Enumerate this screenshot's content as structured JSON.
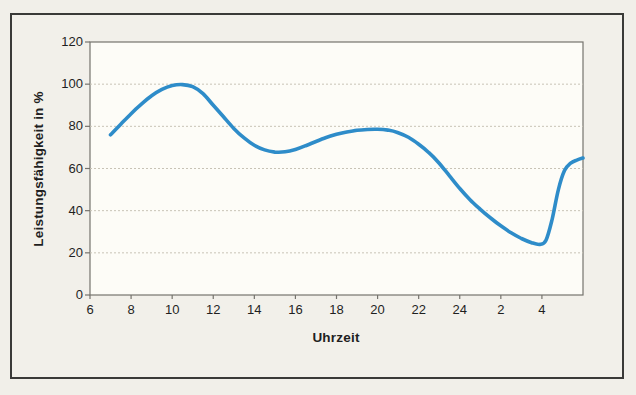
{
  "chart_data": {
    "type": "line",
    "title": "",
    "xlabel": "Uhrzeit",
    "ylabel": "Leistungsfähigkeit in %",
    "x_tick_labels": [
      "6",
      "8",
      "10",
      "12",
      "14",
      "16",
      "18",
      "20",
      "22",
      "24",
      "2",
      "4"
    ],
    "x_tick_hours": [
      6,
      8,
      10,
      12,
      14,
      16,
      18,
      20,
      22,
      24,
      26,
      28
    ],
    "y_ticks": [
      0,
      20,
      40,
      60,
      80,
      100,
      120
    ],
    "xlim": [
      6,
      30
    ],
    "ylim": [
      0,
      120
    ],
    "grid": "horizontal-dashed",
    "legend": "none",
    "series": [
      {
        "name": "Leistungsfähigkeit",
        "points": [
          [
            7,
            76
          ],
          [
            7.5,
            81
          ],
          [
            8,
            86
          ],
          [
            8.5,
            90.5
          ],
          [
            9,
            94.5
          ],
          [
            9.5,
            97.5
          ],
          [
            10,
            99.3
          ],
          [
            10.5,
            99.8
          ],
          [
            11,
            98.8
          ],
          [
            11.5,
            95.5
          ],
          [
            12,
            90
          ],
          [
            12.5,
            84.5
          ],
          [
            13,
            79
          ],
          [
            13.5,
            74.5
          ],
          [
            14,
            71
          ],
          [
            14.5,
            68.8
          ],
          [
            15,
            67.8
          ],
          [
            15.5,
            67.9
          ],
          [
            16,
            69
          ],
          [
            16.5,
            70.8
          ],
          [
            17,
            72.8
          ],
          [
            17.5,
            74.7
          ],
          [
            18,
            76.2
          ],
          [
            18.5,
            77.3
          ],
          [
            19,
            78.1
          ],
          [
            19.5,
            78.5
          ],
          [
            20,
            78.6
          ],
          [
            20.5,
            78.2
          ],
          [
            21,
            77
          ],
          [
            21.5,
            74.8
          ],
          [
            22,
            71.5
          ],
          [
            22.5,
            67.5
          ],
          [
            23,
            62.5
          ],
          [
            23.5,
            56.5
          ],
          [
            24,
            50.5
          ],
          [
            24.5,
            45.2
          ],
          [
            25,
            40.6
          ],
          [
            25.5,
            36.5
          ],
          [
            26,
            32.8
          ],
          [
            26.5,
            29.5
          ],
          [
            27,
            26.8
          ],
          [
            27.5,
            24.8
          ],
          [
            27.9,
            24
          ],
          [
            28.2,
            26
          ],
          [
            28.5,
            36
          ],
          [
            28.8,
            50
          ],
          [
            29.1,
            59
          ],
          [
            29.4,
            62.5
          ],
          [
            29.7,
            64
          ],
          [
            30,
            65
          ]
        ]
      }
    ]
  },
  "colors": {
    "page_bg": "#f1efe9",
    "plot_bg": "#fdfcf7",
    "frame_border": "#3a3a38",
    "plot_border": "#75736d",
    "gridline": "#c8c3b6",
    "axis_text": "#1f1f1f",
    "line": "#2e8cc9"
  }
}
